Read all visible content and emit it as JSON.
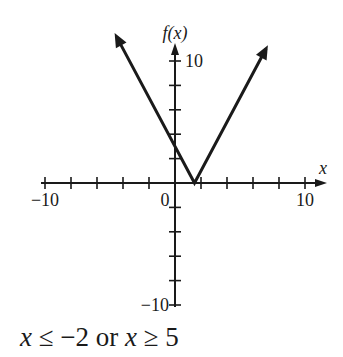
{
  "chart_data": {
    "type": "line",
    "title": "",
    "xlabel": "x",
    "ylabel": "f(x)",
    "xlim": [
      -10,
      10
    ],
    "ylim": [
      -10,
      10
    ],
    "x_ticks": [
      -10,
      -8,
      -6,
      -4,
      -2,
      0,
      2,
      4,
      6,
      8,
      10
    ],
    "y_ticks": [
      -10,
      -8,
      -6,
      -4,
      -2,
      2,
      4,
      6,
      8,
      10
    ],
    "x_tick_labels": [
      {
        "value": -10,
        "label": "−10"
      },
      {
        "value": 0,
        "label": "0"
      },
      {
        "value": 10,
        "label": "10"
      }
    ],
    "y_tick_labels": [
      {
        "value": 10,
        "label": "10"
      },
      {
        "value": -10,
        "label": "−10"
      }
    ],
    "grid": false,
    "series": [
      {
        "name": "f(x)",
        "points": [
          [
            -4.5,
            12
          ],
          [
            1.5,
            0
          ],
          [
            7,
            11
          ]
        ],
        "arrows_at_ends": true
      }
    ]
  },
  "caption": {
    "part1": "x",
    "part2": " ≤ −2 or ",
    "part3": "x",
    "part4": " ≥ 5"
  }
}
